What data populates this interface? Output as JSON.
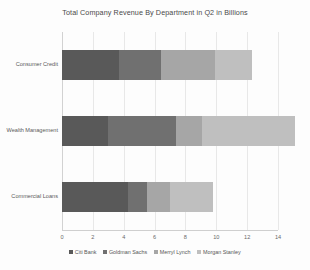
{
  "chart_data": {
    "type": "bar",
    "orientation": "horizontal",
    "stacked": true,
    "title": "Total Company Revenue By Department in Q2 in Billions",
    "xlabel": "",
    "ylabel": "",
    "xlim": [
      0,
      14
    ],
    "xticks": [
      "0",
      "2",
      "4",
      "6",
      "8",
      "10",
      "12",
      "14"
    ],
    "grid": true,
    "legend_position": "bottom",
    "categories": [
      "Consumer Credit",
      "Wealth Management",
      "Commercial Loans"
    ],
    "series": [
      {
        "name": "Citi Bank",
        "color": "#595959",
        "values": [
          3.7,
          3.0,
          4.3
        ]
      },
      {
        "name": "Goldman Sachs",
        "color": "#707070",
        "values": [
          2.7,
          4.4,
          1.2
        ]
      },
      {
        "name": "Merryl Lynch",
        "color": "#a6a6a6",
        "values": [
          3.5,
          1.7,
          1.5
        ]
      },
      {
        "name": "Morgan Stanley",
        "color": "#bfbfbf",
        "values": [
          2.4,
          6.0,
          2.8
        ]
      }
    ],
    "totals": [
      12.3,
      15.1,
      9.8
    ]
  },
  "axis": {
    "ticks_x": [
      {
        "label": "0",
        "value": 0
      },
      {
        "label": "2",
        "value": 2
      },
      {
        "label": "4",
        "value": 4
      },
      {
        "label": "6",
        "value": 6
      },
      {
        "label": "8",
        "value": 8
      },
      {
        "label": "10",
        "value": 10
      },
      {
        "label": "12",
        "value": 12
      },
      {
        "label": "14",
        "value": 14
      }
    ]
  }
}
